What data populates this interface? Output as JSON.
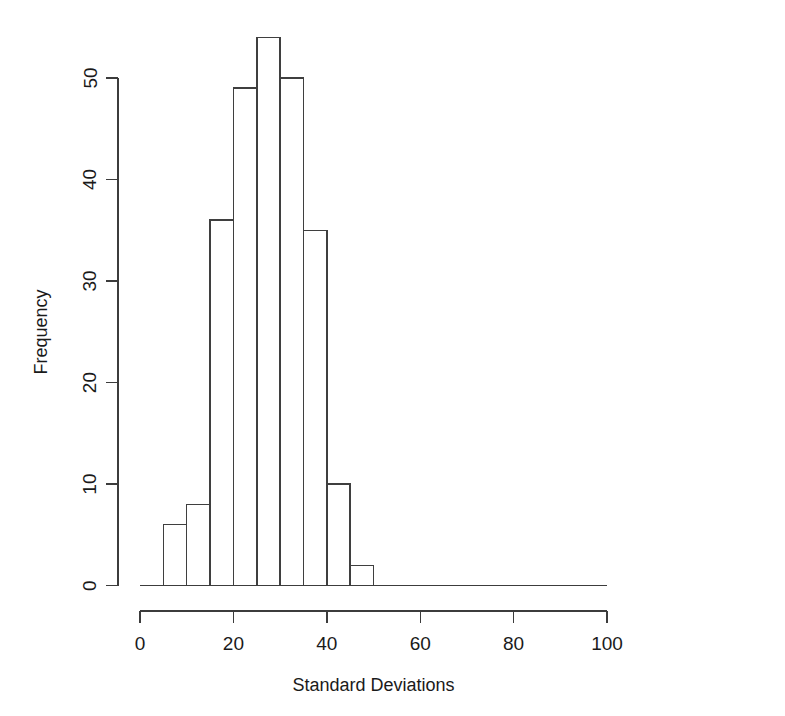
{
  "chart_data": {
    "type": "bar",
    "title": "",
    "subtitle": "",
    "xlabel": "Standard Deviations",
    "ylabel": "Frequency",
    "xlim": [
      0,
      100
    ],
    "ylim": [
      0,
      54
    ],
    "grid": false,
    "legend": null,
    "bin_width": 5,
    "bin_edges": [
      5,
      10,
      15,
      20,
      25,
      30,
      35,
      40,
      45,
      50
    ],
    "categories": [
      "5-10",
      "10-15",
      "15-20",
      "20-25",
      "25-30",
      "30-35",
      "35-40",
      "40-45",
      "45-50"
    ],
    "values": [
      6,
      8,
      36,
      49,
      54,
      50,
      35,
      10,
      2
    ],
    "x_ticks": [
      {
        "value": 0,
        "label": "0"
      },
      {
        "value": 20,
        "label": "20"
      },
      {
        "value": 40,
        "label": "40"
      },
      {
        "value": 60,
        "label": "60"
      },
      {
        "value": 80,
        "label": "80"
      },
      {
        "value": 100,
        "label": "100"
      }
    ],
    "y_ticks": [
      {
        "value": 0,
        "label": "0"
      },
      {
        "value": 10,
        "label": "10"
      },
      {
        "value": 20,
        "label": "20"
      },
      {
        "value": 30,
        "label": "30"
      },
      {
        "value": 40,
        "label": "40"
      },
      {
        "value": 50,
        "label": "50"
      }
    ],
    "y_axis_range": [
      0,
      50
    ],
    "colors": {
      "bar_fill": "#ffffff",
      "bar_stroke": "#3f3f3f",
      "axis": "#3c3c3c",
      "text": "#1a1a1a",
      "background": "#ffffff"
    }
  }
}
